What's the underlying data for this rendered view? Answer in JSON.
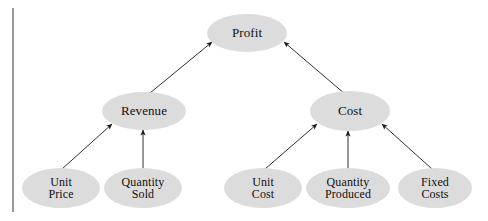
{
  "diagram": {
    "type": "hierarchy-tree",
    "colors": {
      "node_fill": "#dcdcdc",
      "node_text": "#111111",
      "arrow": "#1a1a1a",
      "margin_rule": "#9a9a9a",
      "background": "#ffffff"
    },
    "margin_rule": {
      "x": 13,
      "y_top": 8,
      "y_bottom": 212,
      "width": 2
    },
    "nodes": [
      {
        "id": "profit",
        "label_lines": [
          "Profit"
        ],
        "cx": 247,
        "cy": 33,
        "rx": 40,
        "ry": 19,
        "font_size": 13
      },
      {
        "id": "revenue",
        "label_lines": [
          "Revenue"
        ],
        "cx": 144,
        "cy": 111,
        "rx": 42,
        "ry": 19,
        "font_size": 13
      },
      {
        "id": "cost",
        "label_lines": [
          "Cost"
        ],
        "cx": 350,
        "cy": 111,
        "rx": 40,
        "ry": 20,
        "font_size": 13
      },
      {
        "id": "unit-price",
        "label_lines": [
          "Unit",
          "Price"
        ],
        "cx": 61,
        "cy": 188,
        "rx": 39,
        "ry": 20,
        "font_size": 12
      },
      {
        "id": "quantity-sold",
        "label_lines": [
          "Quantity",
          "Sold"
        ],
        "cx": 143,
        "cy": 188,
        "rx": 39,
        "ry": 20,
        "font_size": 12
      },
      {
        "id": "unit-cost",
        "label_lines": [
          "Unit",
          "Cost"
        ],
        "cx": 263,
        "cy": 188,
        "rx": 39,
        "ry": 20,
        "font_size": 12
      },
      {
        "id": "quantity-produced",
        "label_lines": [
          "Quantity",
          "Produced"
        ],
        "cx": 348,
        "cy": 188,
        "rx": 42,
        "ry": 20,
        "font_size": 12
      },
      {
        "id": "fixed-costs",
        "label_lines": [
          "Fixed",
          "Costs"
        ],
        "cx": 435,
        "cy": 188,
        "rx": 37,
        "ry": 20,
        "font_size": 12
      }
    ],
    "edges": [
      {
        "id": "revenue-to-profit",
        "from": "revenue",
        "to": "profit",
        "x1": 150,
        "y1": 93,
        "x2": 212,
        "y2": 42
      },
      {
        "id": "cost-to-profit",
        "from": "cost",
        "to": "profit",
        "x1": 345,
        "y1": 94,
        "x2": 284,
        "y2": 42
      },
      {
        "id": "unit-price-to-revenue",
        "from": "unit-price",
        "to": "revenue",
        "x1": 62,
        "y1": 169,
        "x2": 112,
        "y2": 124
      },
      {
        "id": "quantity-sold-to-revenue",
        "from": "quantity-sold",
        "to": "revenue",
        "x1": 143,
        "y1": 169,
        "x2": 143,
        "y2": 130
      },
      {
        "id": "unit-cost-to-cost",
        "from": "unit-cost",
        "to": "cost",
        "x1": 265,
        "y1": 169,
        "x2": 317,
        "y2": 124
      },
      {
        "id": "quantity-produced-to-cost",
        "from": "quantity-produced",
        "to": "cost",
        "x1": 348,
        "y1": 169,
        "x2": 348,
        "y2": 131
      },
      {
        "id": "fixed-costs-to-cost",
        "from": "fixed-costs",
        "to": "cost",
        "x1": 432,
        "y1": 169,
        "x2": 382,
        "y2": 124
      }
    ]
  }
}
